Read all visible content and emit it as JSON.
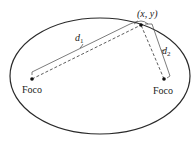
{
  "diagram": {
    "type": "ellipse-foci",
    "colors": {
      "stroke": "#2a2a2a",
      "fill": "#ffffff"
    },
    "point_label": "(x, y)",
    "distance_labels": {
      "d1": "d",
      "d1_sub": "1",
      "d2": "d",
      "d2_sub": "2"
    },
    "foci": [
      {
        "label": "Foco",
        "position": "left"
      },
      {
        "label": "Foco",
        "position": "right"
      }
    ]
  }
}
